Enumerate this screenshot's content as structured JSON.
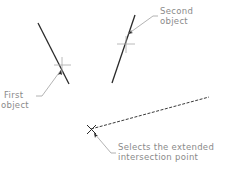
{
  "diagram": {
    "labels": {
      "first_line1": "First",
      "first_line2": "object",
      "second_line1": "Second",
      "second_line2": "object",
      "result_line1": "Selects the extended",
      "result_line2": "intersection point"
    },
    "colors": {
      "object_line": "#2a2a2a",
      "crosshair": "#a8a8a8",
      "leader": "#a0a0a0",
      "label_text": "#8a8a8a",
      "dashed_extension": "#3a3a3a"
    }
  }
}
